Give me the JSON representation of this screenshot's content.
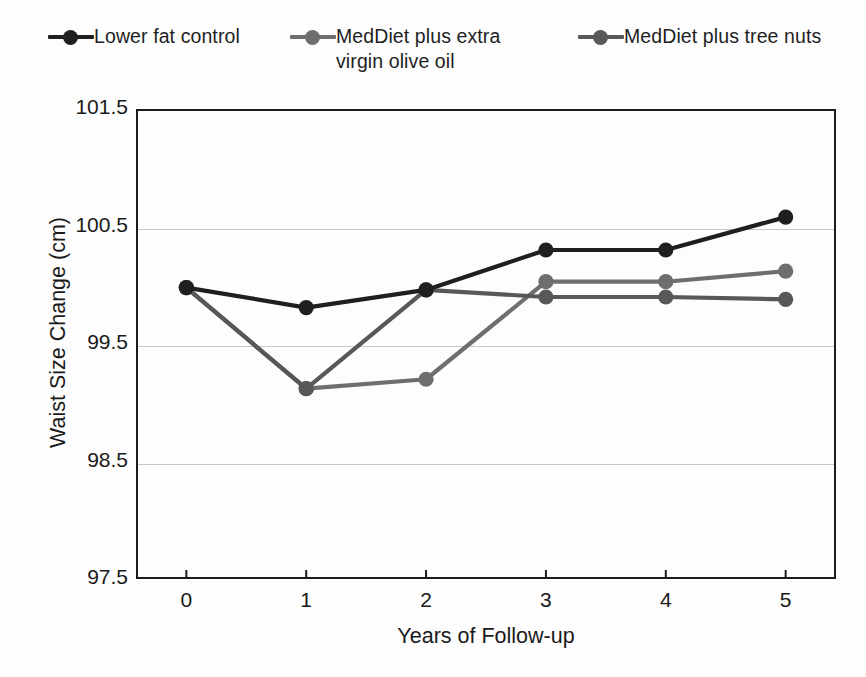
{
  "chart_data": {
    "type": "line",
    "title": "",
    "xlabel": "Years of Follow-up",
    "ylabel": "Waist Size  Change (cm)",
    "x": [
      0,
      1,
      2,
      3,
      4,
      5
    ],
    "categories": [
      "0",
      "1",
      "2",
      "3",
      "4",
      "5"
    ],
    "xlim": [
      -0.42,
      5.42
    ],
    "ylim": [
      97.5,
      101.5
    ],
    "yticks": [
      101.5,
      100.5,
      99.5,
      98.5,
      97.5
    ],
    "ytick_labels": [
      "101.5",
      "100.5",
      "99.5",
      "98.5",
      "97.5"
    ],
    "xticks": [
      0,
      1,
      2,
      3,
      4,
      5
    ],
    "xtick_labels": [
      "0",
      "1",
      "2",
      "3",
      "4",
      "5"
    ],
    "grid": "horizontal",
    "grid_color": "#c9c9c9",
    "legend_position": "top",
    "marker": "circle",
    "series": [
      {
        "name": "Lower fat control",
        "color": "#1f1f1f",
        "values": [
          99.98,
          99.81,
          99.96,
          100.3,
          100.3,
          100.58
        ]
      },
      {
        "name": "MedDiet plus extra\nvirgin olive oil",
        "color": "#6e6e6e",
        "values": [
          99.98,
          99.12,
          99.2,
          100.03,
          100.03,
          100.12
        ]
      },
      {
        "name": "MedDiet plus tree nuts",
        "color": "#585858",
        "values": [
          99.98,
          99.12,
          99.96,
          99.9,
          99.9,
          99.88
        ]
      }
    ]
  },
  "legend": {
    "entries": [
      {
        "label": "Lower fat control",
        "marker_name": "legend-marker-lower-fat-control"
      },
      {
        "label": "MedDiet plus extra\nvirgin olive oil",
        "marker_name": "legend-marker-meddiet-olive-oil"
      },
      {
        "label": "MedDiet plus tree nuts",
        "marker_name": "legend-marker-meddiet-tree-nuts"
      }
    ]
  },
  "axes": {
    "y_title": "Waist Size  Change (cm)",
    "x_title": "Years of Follow-up",
    "y_tick_labels": [
      "101.5",
      "100.5",
      "99.5",
      "98.5",
      "97.5"
    ],
    "x_tick_labels": [
      "0",
      "1",
      "2",
      "3",
      "4",
      "5"
    ]
  },
  "colors": {
    "series_1": "#1f1f1f",
    "series_2": "#6e6e6e",
    "series_3": "#585858",
    "axis": "#1c1c1c",
    "grid": "#c9c9c9",
    "background": "#fdfdfd"
  }
}
